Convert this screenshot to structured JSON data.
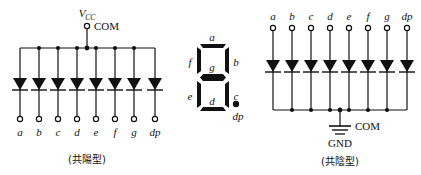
{
  "figure": {
    "title": "",
    "background": "#ffffff",
    "ink_color": "#111111"
  },
  "left_circuit": {
    "name": "common-anode-led-array",
    "supply_label": "V",
    "supply_sub": "CC",
    "common_label": "COM",
    "caption": "(共陽型)",
    "caption_meaning": "common anode type",
    "diode_count": 8,
    "diode_direction": "down",
    "terminals": [
      "a",
      "b",
      "c",
      "d",
      "e",
      "f",
      "g",
      "dp"
    ]
  },
  "seven_segment": {
    "name": "seven-segment-display",
    "segments": {
      "a": "a",
      "b": "b",
      "c": "c",
      "d": "d",
      "e": "e",
      "f": "f",
      "g": "g"
    },
    "decimal_point": "dp",
    "segment_color": "#111111"
  },
  "right_circuit": {
    "name": "common-cathode-led-array",
    "common_label": "COM",
    "ground_label": "GND",
    "caption": "(共陰型)",
    "caption_meaning": "common cathode type",
    "diode_count": 8,
    "diode_direction": "down",
    "terminals": [
      "a",
      "b",
      "c",
      "d",
      "e",
      "f",
      "g",
      "dp"
    ]
  }
}
